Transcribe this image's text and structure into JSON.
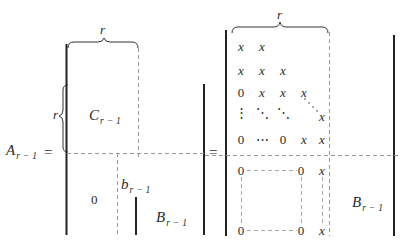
{
  "equation": {
    "lhs": {
      "base": "A",
      "subscript": "r − 1",
      "equals": "="
    },
    "equals_mid": "=",
    "left_matrix": {
      "top_brace_label": "r",
      "side_brace_label": "r",
      "block_C": {
        "base": "C",
        "subscript": "r − 1"
      },
      "block_zero": "0",
      "block_b": {
        "base": "b",
        "subscript": "r − 1"
      },
      "block_B": {
        "base": "B",
        "subscript": "r − 1"
      }
    },
    "right_matrix": {
      "top_brace_label": "r",
      "upper_rows": [
        [
          "x",
          "x",
          "",
          "",
          ""
        ],
        [
          "x",
          "x",
          "x",
          "",
          ""
        ],
        [
          "0",
          "x",
          "x",
          "x",
          ""
        ],
        [
          "⋮",
          "⋱",
          "⋱",
          "⋱",
          "x"
        ],
        [
          "0",
          "⋯",
          "0",
          "x",
          "x"
        ]
      ],
      "lower_block": {
        "top_left": "0",
        "top_right": "0",
        "bottom_left": "0",
        "bottom_right": "0",
        "col_top": "x",
        "col_bottom": "x"
      },
      "block_B": {
        "base": "B",
        "subscript": "r − 1"
      }
    }
  }
}
